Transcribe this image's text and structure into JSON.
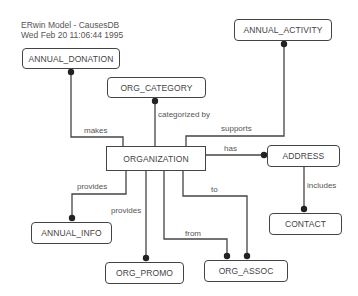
{
  "header": {
    "title": "ERwin Model - CausesDB",
    "timestamp": "Wed Feb 20 11:06:44 1995"
  },
  "entities": {
    "annual_donation": {
      "name": "ANNUAL_DONATION",
      "type": "dependent"
    },
    "org_category": {
      "name": "ORG_CATEGORY",
      "type": "dependent"
    },
    "annual_activity": {
      "name": "ANNUAL_ACTIVITY",
      "type": "dependent"
    },
    "organization": {
      "name": "ORGANIZATION",
      "type": "independent"
    },
    "address": {
      "name": "ADDRESS",
      "type": "dependent"
    },
    "contact": {
      "name": "CONTACT",
      "type": "dependent"
    },
    "annual_info": {
      "name": "ANNUAL_INFO",
      "type": "dependent"
    },
    "org_promo": {
      "name": "ORG_PROMO",
      "type": "dependent"
    },
    "org_assoc": {
      "name": "ORG_ASSOC",
      "type": "dependent"
    }
  },
  "relationships": [
    {
      "from": "ORGANIZATION",
      "to": "ANNUAL_DONATION",
      "label": "makes"
    },
    {
      "from": "ORGANIZATION",
      "to": "ORG_CATEGORY",
      "label": "categorized by"
    },
    {
      "from": "ORGANIZATION",
      "to": "ANNUAL_ACTIVITY",
      "label": "supports"
    },
    {
      "from": "ORGANIZATION",
      "to": "ADDRESS",
      "label": "has"
    },
    {
      "from": "ADDRESS",
      "to": "CONTACT",
      "label": "includes"
    },
    {
      "from": "ORGANIZATION",
      "to": "ANNUAL_INFO",
      "label": "provides"
    },
    {
      "from": "ORGANIZATION",
      "to": "ORG_PROMO",
      "label": "provides"
    },
    {
      "from": "ORGANIZATION",
      "to": "ORG_ASSOC",
      "label": "from"
    },
    {
      "from": "ORGANIZATION",
      "to": "ORG_ASSOC",
      "label": "to"
    }
  ],
  "colors": {
    "line": "#444444",
    "text": "#444444",
    "background": "#ffffff"
  }
}
